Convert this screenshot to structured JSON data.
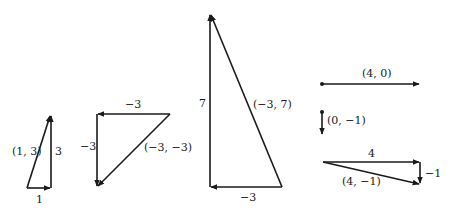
{
  "diagram": {
    "stroke_color": "#1a1a1a",
    "background": "#ffffff",
    "triangles": [
      {
        "id": "tri-1-3",
        "labels": {
          "horizontal": "1",
          "vertical": "3",
          "resultant": "(1, 3)"
        }
      },
      {
        "id": "tri-neg3-neg3",
        "labels": {
          "horizontal": "−3",
          "vertical": "−3",
          "resultant": "(−3, −3)"
        }
      },
      {
        "id": "tri-neg3-7",
        "labels": {
          "horizontal": "−3",
          "vertical": "7",
          "resultant": "(−3, 7)"
        }
      },
      {
        "id": "tri-4-neg1",
        "labels": {
          "horizontal": "4",
          "vertical": "−1",
          "resultant": "(4, −1)"
        }
      }
    ],
    "single_vectors": [
      {
        "id": "vec-4-0",
        "label": "(4, 0)"
      },
      {
        "id": "vec-0-neg1",
        "label": "(0, −1)"
      }
    ]
  }
}
